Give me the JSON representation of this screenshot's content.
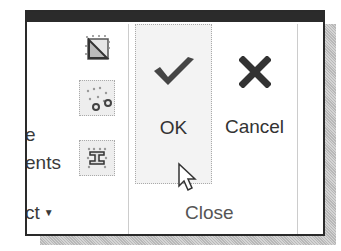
{
  "left_group": {
    "text_fragments": [
      "e",
      "ents",
      "ct"
    ],
    "dropdown_arrow": "▼",
    "icons": [
      "grid-diagonal-icon",
      "scatter-points-icon",
      "i-beam-grid-icon"
    ]
  },
  "close_group": {
    "ok": {
      "label": "OK",
      "icon": "checkmark-icon"
    },
    "cancel": {
      "label": "Cancel",
      "icon": "x-mark-icon"
    },
    "label": "Close"
  },
  "cursor": "mouse-pointer-icon",
  "colors": {
    "icon_dark": "#404040",
    "border": "#2a2a2a",
    "button_bg": "#f3f3f3"
  }
}
